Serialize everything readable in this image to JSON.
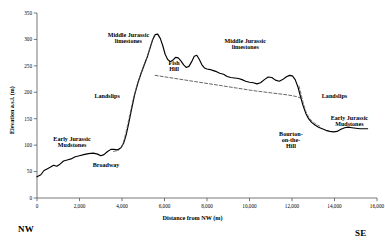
{
  "chart_data": {
    "type": "line",
    "title": "",
    "xlabel": "Distance from NW (m)",
    "ylabel": "Elevation a.s.l. (m)",
    "xlim": [
      0,
      16000
    ],
    "ylim": [
      0,
      350
    ],
    "xticks": [
      0,
      2000,
      4000,
      6000,
      8000,
      10000,
      12000,
      14000,
      16000
    ],
    "xtick_labels": [
      "0",
      "2,000",
      "4,000",
      "6,000",
      "8,000",
      "10,000",
      "12,000",
      "14,000",
      "16,000"
    ],
    "yticks": [
      0,
      50,
      100,
      150,
      200,
      250,
      300,
      350
    ],
    "ytick_labels": [
      "0",
      "50",
      "100",
      "150",
      "200",
      "250",
      "300",
      "350"
    ],
    "grid": false,
    "legend": "none",
    "series": [
      {
        "name": "topographic-profile",
        "style": "solid",
        "color": "#000000",
        "points": [
          [
            0,
            40
          ],
          [
            180,
            44
          ],
          [
            330,
            52
          ],
          [
            470,
            55
          ],
          [
            620,
            58
          ],
          [
            780,
            62
          ],
          [
            930,
            60
          ],
          [
            1080,
            64
          ],
          [
            1250,
            70
          ],
          [
            1420,
            72
          ],
          [
            1600,
            74
          ],
          [
            1800,
            78
          ],
          [
            2000,
            80
          ],
          [
            2200,
            82
          ],
          [
            2420,
            84
          ],
          [
            2650,
            85
          ],
          [
            2850,
            83
          ],
          [
            3000,
            80
          ],
          [
            3150,
            82
          ],
          [
            3320,
            88
          ],
          [
            3480,
            92
          ],
          [
            3620,
            92
          ],
          [
            3780,
            91
          ],
          [
            3950,
            95
          ],
          [
            4080,
            104
          ],
          [
            4200,
            120
          ],
          [
            4320,
            142
          ],
          [
            4450,
            168
          ],
          [
            4600,
            196
          ],
          [
            4750,
            218
          ],
          [
            4900,
            236
          ],
          [
            5050,
            252
          ],
          [
            5200,
            268
          ],
          [
            5330,
            285
          ],
          [
            5450,
            300
          ],
          [
            5560,
            309
          ],
          [
            5680,
            310
          ],
          [
            5800,
            302
          ],
          [
            5920,
            288
          ],
          [
            6030,
            272
          ],
          [
            6150,
            262
          ],
          [
            6280,
            258
          ],
          [
            6400,
            261
          ],
          [
            6520,
            266
          ],
          [
            6650,
            265
          ],
          [
            6780,
            259
          ],
          [
            6900,
            252
          ],
          [
            7020,
            247
          ],
          [
            7150,
            249
          ],
          [
            7280,
            258
          ],
          [
            7400,
            268
          ],
          [
            7520,
            270
          ],
          [
            7640,
            262
          ],
          [
            7760,
            252
          ],
          [
            7880,
            246
          ],
          [
            8000,
            244
          ],
          [
            8150,
            243
          ],
          [
            8300,
            241
          ],
          [
            8450,
            239
          ],
          [
            8600,
            236
          ],
          [
            8780,
            234
          ],
          [
            8950,
            230
          ],
          [
            9120,
            228
          ],
          [
            9300,
            227
          ],
          [
            9480,
            226
          ],
          [
            9650,
            224
          ],
          [
            9820,
            221
          ],
          [
            10000,
            219
          ],
          [
            10180,
            218
          ],
          [
            10350,
            216
          ],
          [
            10520,
            218
          ],
          [
            10700,
            224
          ],
          [
            10880,
            229
          ],
          [
            11050,
            228
          ],
          [
            11220,
            223
          ],
          [
            11400,
            221
          ],
          [
            11560,
            224
          ],
          [
            11720,
            229
          ],
          [
            11880,
            232
          ],
          [
            12020,
            231
          ],
          [
            12150,
            224
          ],
          [
            12280,
            210
          ],
          [
            12400,
            192
          ],
          [
            12520,
            175
          ],
          [
            12650,
            160
          ],
          [
            12780,
            150
          ],
          [
            12920,
            143
          ],
          [
            13080,
            138
          ],
          [
            13250,
            134
          ],
          [
            13420,
            131
          ],
          [
            13600,
            128
          ],
          [
            13780,
            126
          ],
          [
            13950,
            125
          ],
          [
            14120,
            126
          ],
          [
            14300,
            130
          ],
          [
            14480,
            133
          ],
          [
            14650,
            134
          ],
          [
            14820,
            133
          ],
          [
            15000,
            132
          ],
          [
            15200,
            131
          ],
          [
            15400,
            131
          ],
          [
            15560,
            131
          ]
        ]
      },
      {
        "name": "landslip-back-scar-upper",
        "style": "dashed",
        "color": "#333333",
        "points": [
          [
            5560,
            232
          ],
          [
            6200,
            228
          ],
          [
            7000,
            223
          ],
          [
            7800,
            218
          ],
          [
            8600,
            213
          ],
          [
            9400,
            208
          ],
          [
            10200,
            203
          ],
          [
            11000,
            199
          ],
          [
            11800,
            195
          ],
          [
            12200,
            192
          ],
          [
            12420,
            189
          ]
        ]
      },
      {
        "name": "landslip-back-scar-lower",
        "style": "dashed",
        "color": "#555555",
        "points": [
          [
            3600,
            88
          ],
          [
            3830,
            90
          ],
          [
            3980,
            96
          ],
          [
            4100,
            110
          ],
          [
            4230,
            132
          ],
          [
            4370,
            158
          ],
          [
            4520,
            186
          ],
          [
            4680,
            210
          ],
          [
            4840,
            230
          ],
          [
            5000,
            248
          ],
          [
            5160,
            265
          ],
          [
            5300,
            282
          ],
          [
            5420,
            298
          ],
          [
            5520,
            308
          ]
        ]
      },
      {
        "name": "landslip-scar-southeast",
        "style": "dashed",
        "color": "#555555",
        "points": [
          [
            12330,
            212
          ],
          [
            12430,
            196
          ],
          [
            12540,
            178
          ],
          [
            12660,
            163
          ],
          [
            12800,
            152
          ],
          [
            12950,
            145
          ],
          [
            13120,
            140
          ],
          [
            13300,
            136
          ]
        ]
      }
    ],
    "annotations": [
      {
        "name": "early-jurassic-mudstones-west",
        "text": "Early Jurassic\nMudstones",
        "x": 1650,
        "y": 108
      },
      {
        "name": "broadway",
        "text": "Broadway",
        "x": 3250,
        "y": 58
      },
      {
        "name": "landslips-west",
        "text": "Landslips",
        "x": 3300,
        "y": 190
      },
      {
        "name": "middle-jurassic-limestones-west",
        "text": "Middle Jurassic\nlimestones",
        "x": 4300,
        "y": 305
      },
      {
        "name": "fish-hill",
        "text": "Fish\nHill",
        "x": 6450,
        "y": 252
      },
      {
        "name": "middle-jurassic-limestones-east",
        "text": "Middle Jurassic\nlimestones",
        "x": 9800,
        "y": 293
      },
      {
        "name": "bourton-on-the-hill",
        "text": "Bourton-\non-the-\nHill",
        "x": 11950,
        "y": 118
      },
      {
        "name": "landslips-east",
        "text": "Landslips",
        "x": 14000,
        "y": 190
      },
      {
        "name": "early-jurassic-mudstones-east",
        "text": "Early Jurassic\nMudstones",
        "x": 14700,
        "y": 148
      }
    ],
    "compass": {
      "left": "NW",
      "right": "SE"
    }
  }
}
